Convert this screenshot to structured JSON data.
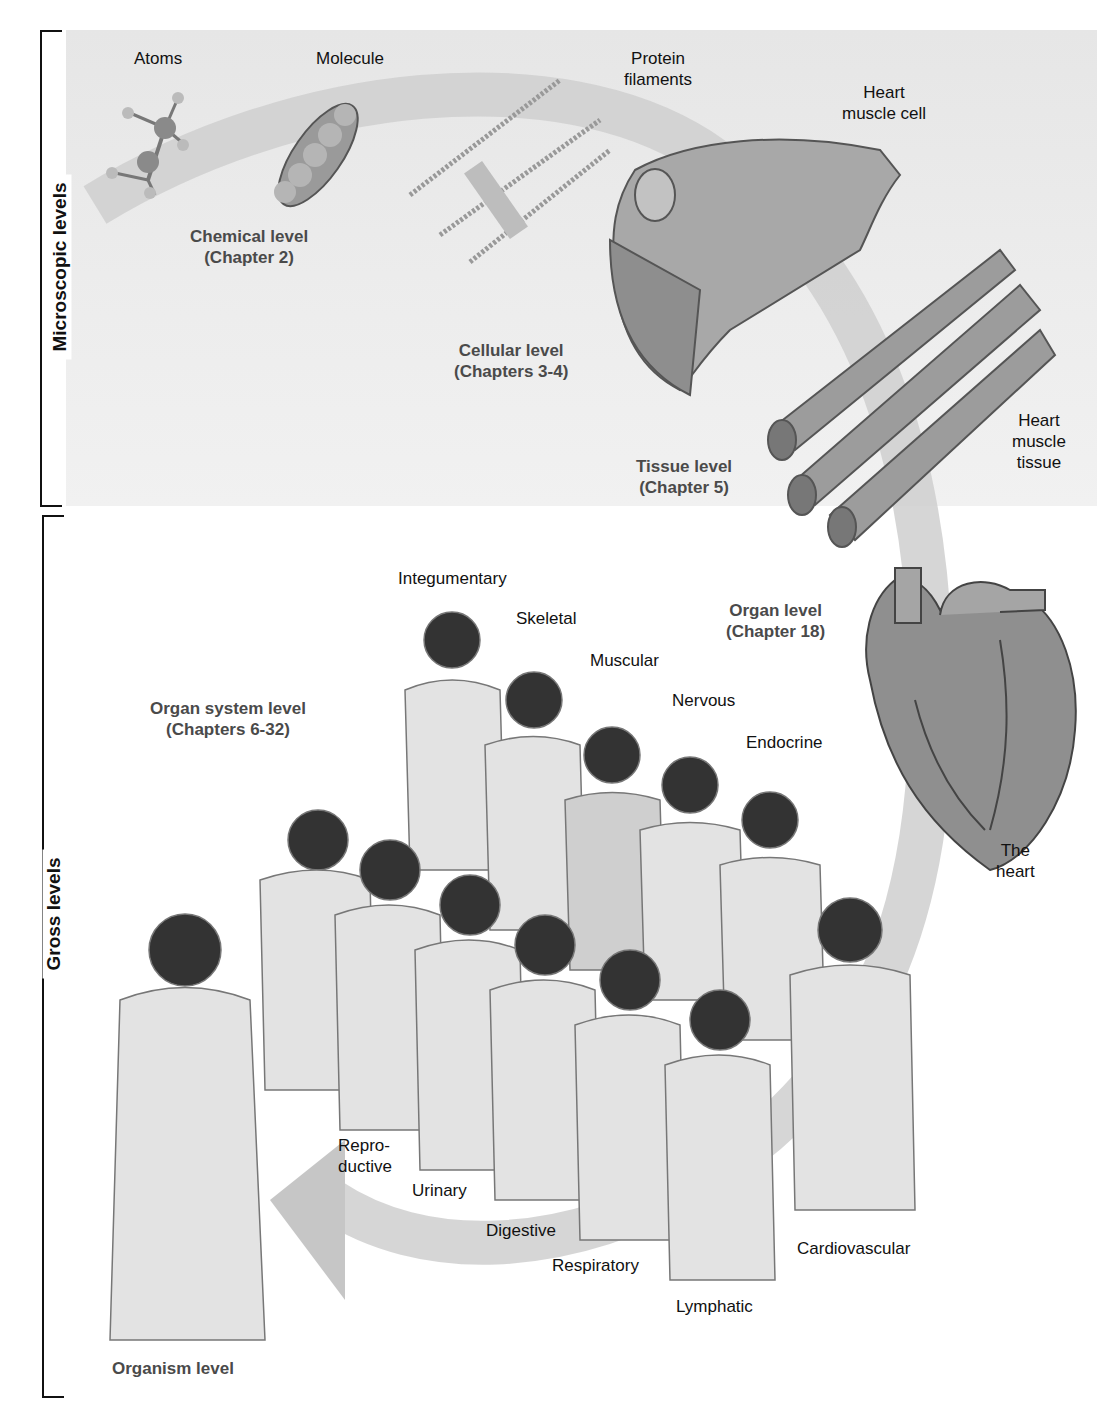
{
  "figure": {
    "brackets": {
      "microscopic": "Microscopic levels",
      "gross": "Gross levels"
    },
    "structure_labels": {
      "atoms": "Atoms",
      "molecule": "Molecule",
      "protein_filaments_1": "Protein",
      "protein_filaments_2": "filaments",
      "heart_muscle_cell_1": "Heart",
      "heart_muscle_cell_2": "muscle cell",
      "heart_muscle_tissue_1": "Heart",
      "heart_muscle_tissue_2": "muscle",
      "heart_muscle_tissue_3": "tissue",
      "the_heart_1": "The",
      "the_heart_2": "heart"
    },
    "levels": {
      "chemical": {
        "name": "Chemical level",
        "chapter": "(Chapter 2)"
      },
      "cellular": {
        "name": "Cellular level",
        "chapter": "(Chapters 3-4)"
      },
      "tissue": {
        "name": "Tissue level",
        "chapter": "(Chapter 5)"
      },
      "organ": {
        "name": "Organ level",
        "chapter": "(Chapter 18)"
      },
      "organ_system": {
        "name": "Organ system level",
        "chapter": "(Chapters 6-32)"
      },
      "organism": {
        "name": "Organism level"
      }
    },
    "organ_systems": {
      "integumentary": "Integumentary",
      "skeletal": "Skeletal",
      "muscular": "Muscular",
      "nervous": "Nervous",
      "endocrine": "Endocrine",
      "cardiovascular": "Cardiovascular",
      "lymphatic": "Lymphatic",
      "respiratory": "Respiratory",
      "digestive": "Digestive",
      "urinary": "Urinary",
      "reproductive_1": "Repro-",
      "reproductive_2": "ductive"
    },
    "colors": {
      "micro_background": "#e8e8e8",
      "arrow": "#c8c8c8",
      "level_text": "#4a4a4a",
      "label_text": "#111111"
    }
  }
}
